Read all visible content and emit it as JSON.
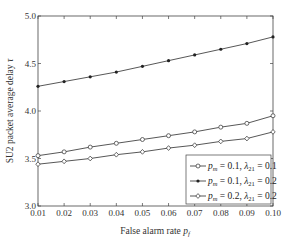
{
  "chart_data": {
    "type": "line",
    "title": "",
    "xlabel": "False alarm rate p_f",
    "xlabel_main": "False alarm rate ",
    "xlabel_sym": "p",
    "xlabel_sub": "f",
    "ylabel": "SU2 packet average delay τ",
    "ylabel_main": "SU2 packet average delay ",
    "ylabel_sym": "τ",
    "xlim": [
      0.01,
      0.1
    ],
    "ylim": [
      3.0,
      5.0
    ],
    "xticks": [
      "0.01",
      "0.02",
      "0.03",
      "0.04",
      "0.05",
      "0.06",
      "0.07",
      "0.08",
      "0.09",
      "0.10"
    ],
    "yticks": [
      "3.0",
      "3.5",
      "4.0",
      "4.5",
      "5.0"
    ],
    "grid": false,
    "legend_position": "bottom-right",
    "x": [
      0.01,
      0.02,
      0.03,
      0.04,
      0.05,
      0.06,
      0.07,
      0.08,
      0.09,
      0.1
    ],
    "series": [
      {
        "name": "p_m = 0.1, λ21 = 0.1",
        "marker": "circle",
        "legend": [
          "= 0.1, ",
          "= 0.1"
        ],
        "values": [
          3.53,
          3.57,
          3.62,
          3.66,
          3.7,
          3.74,
          3.78,
          3.83,
          3.87,
          3.95
        ]
      },
      {
        "name": "p_m = 0.1, λ21 = 0.2",
        "marker": "dot",
        "legend": [
          "= 0.1, ",
          "= 0.2"
        ],
        "values": [
          4.26,
          4.31,
          4.36,
          4.41,
          4.47,
          4.53,
          4.59,
          4.65,
          4.71,
          4.78
        ]
      },
      {
        "name": "p_m = 0.2, λ21 = 0.2",
        "marker": "diamond",
        "legend": [
          "= 0.2, ",
          "= 0.2"
        ],
        "values": [
          3.44,
          3.47,
          3.5,
          3.54,
          3.57,
          3.61,
          3.64,
          3.68,
          3.71,
          3.78
        ]
      }
    ]
  }
}
